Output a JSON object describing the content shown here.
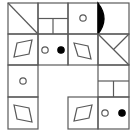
{
  "puzzle": {
    "description": "4x4 figure-pattern grid with missing cells",
    "colors": {
      "line": "#5a5a5a",
      "fill": "#000000",
      "background": "#ffffff"
    },
    "grid": {
      "x": [
        8,
        38,
        68,
        98,
        129
      ],
      "y": [
        3,
        34,
        65,
        97,
        129
      ]
    },
    "cells": [
      {
        "row": 0,
        "col": 0,
        "figure": "diagonal-line"
      },
      {
        "row": 0,
        "col": 1,
        "figure": "t-split-lines"
      },
      {
        "row": 0,
        "col": 2,
        "figure": "open-circle"
      },
      {
        "row": 0,
        "col": 3,
        "figure": "black-half-lens"
      },
      {
        "row": 1,
        "col": 0,
        "figure": "parallelogram-right-lean"
      },
      {
        "row": 1,
        "col": 1,
        "figure": "open-circle-and-filled-dot"
      },
      {
        "row": 1,
        "col": 2,
        "figure": "parallelogram-left-lean"
      },
      {
        "row": 1,
        "col": 3,
        "figure": "crossed-diagonals"
      },
      {
        "row": 2,
        "col": 0,
        "figure": "open-circle"
      },
      {
        "row": 2,
        "col": 3,
        "figure": "t-split-lines"
      },
      {
        "row": 3,
        "col": 0,
        "figure": "parallelogram-left-lean"
      },
      {
        "row": 3,
        "col": 2,
        "figure": "parallelogram-right-lean"
      },
      {
        "row": 3,
        "col": 3,
        "figure": "open-circle-and-filled-dot"
      }
    ],
    "empty_cells": [
      {
        "row": 2,
        "col": 1
      },
      {
        "row": 2,
        "col": 2
      },
      {
        "row": 3,
        "col": 1
      }
    ]
  }
}
